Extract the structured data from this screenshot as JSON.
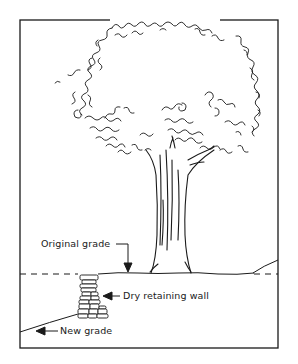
{
  "diagram": {
    "labels": {
      "original_grade": "Original grade",
      "dry_retaining_wall": "Dry retaining wall",
      "new_grade": "New grade"
    },
    "colors": {
      "ink": "#1a1a1a",
      "background": "#ffffff"
    },
    "elements": [
      {
        "name": "frame",
        "type": "rectangle"
      },
      {
        "name": "tree-canopy",
        "type": "illustration"
      },
      {
        "name": "tree-trunk",
        "type": "illustration"
      },
      {
        "name": "original-grade-line",
        "type": "dashed-line"
      },
      {
        "name": "ground-line",
        "type": "line"
      },
      {
        "name": "dry-retaining-wall",
        "type": "stacked-stones"
      },
      {
        "name": "new-grade-slope",
        "type": "line"
      }
    ]
  }
}
